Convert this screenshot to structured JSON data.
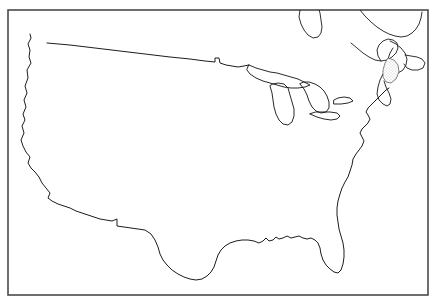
{
  "figure": {
    "kind": "outline-map",
    "background_color": "#ffffff",
    "frame": {
      "name": "map-border-frame",
      "stroke_color": "#4a4a4a",
      "stroke_width": 1.6,
      "x": 8,
      "y": 10,
      "width": 420,
      "height": 285
    },
    "line_color": "#111111",
    "has_labels": false,
    "has_legend": false,
    "has_text": false,
    "has_grid": false,
    "projection_note": "conic, contiguous 48 states"
  },
  "features": [
    {
      "id": "national-outline",
      "name": "contiguous-united-states-outline",
      "description": "Pacific coast, Canadian border, Atlantic coast and Gulf of Mexico coastline of the lower 48 states",
      "path": "M 30 34 L 31 38 L 28 44 L 30 50 L 29 57 L 31 63 L 27 70 L 28 78 L 25 86 L 27 93 L 24 100 L 26 107 L 23 114 L 25 120 L 22 126 L 24 133 L 21 140 L 23 146 L 26 152 L 30 157 L 28 163 L 31 168 L 35 172 L 39 177 L 42 183 L 46 188 L 50 193 L 48 198 L 52 201 L 58 204 L 64 206 L 70 208 L 76 211 L 82 213 L 88 215 L 94 217 L 100 219 L 106 220 L 112 221 L 117 219 L 117 226 L 124 227 L 131 228 L 138 229 L 145 230 L 151 234 L 155 240 L 158 247 L 160 254 L 163 260 L 167 265 L 172 270 L 178 274 L 184 277 L 190 279 L 196 280 L 202 279 L 207 276 L 211 272 L 214 267 L 216 261 L 218 255 L 221 250 L 225 246 L 230 243 L 236 241 L 242 240 L 248 240 L 254 241 L 259 243 L 263 241 L 266 238 L 269 241 L 273 240 L 276 237 L 279 239 L 283 238 L 287 236 L 291 238 L 295 237 L 299 236 L 303 238 L 307 239 L 311 238 L 315 240 L 318 243 L 320 248 L 321 254 L 323 260 L 326 265 L 330 269 L 334 272 L 338 273 L 341 270 L 343 264 L 344 257 L 344 250 L 343 243 L 341 236 L 339 229 L 338 222 L 337 215 L 337 208 L 338 201 L 340 194 L 342 188 L 345 182 L 348 177 L 350 171 L 352 165 L 353 159 L 356 154 L 359 150 L 362 146 L 364 141 L 362 137 L 360 133 L 362 129 L 365 126 L 368 123 L 370 119 L 368 115 L 366 112 L 368 108 L 371 105 L 374 102 L 377 99 L 380 96 L 383 93 L 386 90 L 389 88",
      "interactable": false
    },
    {
      "id": "northern-border",
      "name": "usa-canada-border-49th-parallel",
      "description": "Straight 49th parallel boundary from Puget Sound east to Lake of the Woods, with Northwest Angle notch",
      "path": "M 47 43 L 70 45 L 95 48 L 120 51 L 145 54 L 170 57 L 190 59 L 205 61 L 215 62 L 215 58 L 219 58 L 220 63 L 226 65 L 232 66 L 238 67 L 244 66 L 249 65",
      "interactable": false
    },
    {
      "id": "great-lakes",
      "name": "great-lakes-group",
      "description": "Lake Superior, Lake Michigan, Lake Huron, Lake Erie, Lake Ontario outlines",
      "lakes": [
        {
          "name": "lake-superior",
          "path": "M 249 65 L 256 68 L 263 70 L 270 72 L 277 73 L 284 75 L 291 77 L 298 79 L 304 82 L 310 85 L 305 87 L 298 88 L 291 88 L 284 87 L 277 85 L 270 83 L 263 81 L 256 78 L 250 74 L 247 70 Z"
        },
        {
          "name": "lake-michigan",
          "path": "M 270 86 L 272 93 L 273 100 L 274 107 L 276 114 L 279 120 L 283 124 L 288 125 L 292 122 L 294 116 L 294 109 L 292 102 L 290 95 L 288 88 L 284 84 L 278 83 L 273 84 Z"
        },
        {
          "name": "lake-huron",
          "path": "M 300 84 L 304 89 L 307 95 L 309 101 L 312 107 L 316 111 L 321 113 L 326 112 L 329 108 L 329 102 L 327 96 L 324 91 L 320 87 L 315 84 L 309 82 L 304 82 Z"
        },
        {
          "name": "lake-erie",
          "path": "M 310 114 L 317 117 L 324 119 L 331 120 L 337 119 L 340 116 L 337 113 L 330 112 L 323 112 L 316 112 Z"
        },
        {
          "name": "lake-ontario",
          "path": "M 334 104 L 341 104 L 348 103 L 353 101 L 350 98 L 344 97 L 338 98 L 334 100 Z"
        }
      ],
      "interactable": false
    },
    {
      "id": "canada-ontario-peninsula",
      "name": "canada-bruce-peninsula-outline",
      "description": "Canadian landmass north of Lake Huron extending above the frame edge",
      "path": "M 300 10 L 299 17 L 301 24 L 304 30 L 308 35 L 313 38 L 318 37 L 321 33 L 322 27 L 321 20 L 320 13 L 319 10",
      "interactable": false
    },
    {
      "id": "canada-maritimes",
      "name": "canada-quebec-maritimes-outline",
      "description": "Saint Lawrence, New Brunswick, Nova Scotia and Gulf of Saint Lawrence coastlines in the upper right",
      "paths": [
        "M 360 10 L 365 16 L 371 22 L 377 27 L 383 31 L 389 34 L 395 36 L 401 37 L 407 36 L 412 33 L 416 29 L 419 24 L 421 18 L 422 12",
        "M 351 43 L 357 48 L 363 53 L 369 57 L 375 60 L 381 61 L 387 60 L 392 57 L 396 53 L 398 48 L 397 43 L 393 40 L 388 39 L 383 41 L 379 45 L 377 50 L 378 56 L 381 61",
        "M 390 41 L 396 44 L 401 48 L 405 53 L 407 59 L 406 65 L 403 70 L 398 73 L 393 73 L 389 70 L 387 65 L 388 59 L 390 53 L 393 48",
        "M 405 55 L 411 56 L 417 57 L 422 59 L 425 63 L 423 68 L 418 70 L 412 70 L 407 68 L 404 64",
        "M 383 74 L 380 80 L 378 87 L 377 94 L 379 100 L 383 104 L 387 106 L 390 104 L 391 99 L 389 93 L 386 87 L 384 81"
      ],
      "interactable": false
    },
    {
      "id": "bay-of-fundy-shading",
      "name": "shaded-bay-region",
      "description": "Light stippled shading in the Bay of Fundy / New Brunswick area",
      "path": "M 388 58 L 394 60 L 398 65 L 399 72 L 396 79 L 391 83 L 386 82 L 383 77 L 383 70 L 385 63 Z",
      "interactable": false
    }
  ]
}
